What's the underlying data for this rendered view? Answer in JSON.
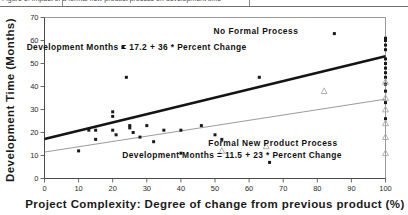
{
  "caption": {
    "text": "Figure 1.  Impact of a formal new product process on development time",
    "visible_fragment": true
  },
  "chart_data": {
    "type": "scatter",
    "title": "",
    "xlabel": "Project Complexity: Degree of change from previous product (%)",
    "ylabel": "Development Time (Months)",
    "xlim": [
      0,
      100
    ],
    "ylim": [
      0,
      70
    ],
    "xticks": [
      0,
      10,
      20,
      30,
      40,
      50,
      60,
      70,
      80,
      90,
      100
    ],
    "yticks": [
      0,
      10,
      20,
      30,
      40,
      50,
      60,
      70
    ],
    "grid": false,
    "legend": "none",
    "annotations": [
      {
        "id": "group-a-title",
        "text": "No Formal Process",
        "x": 62,
        "y": 63
      },
      {
        "id": "group-a-equation",
        "text": "Development Months = 17.2 + 36 * Percent Change",
        "x": 27,
        "y": 56
      },
      {
        "id": "group-b-title",
        "text": "Formal New Product Process",
        "x": 67,
        "y": 14
      },
      {
        "id": "group-b-equation",
        "text": "Development Months = 11.5 + 23 * Percent Change",
        "x": 55,
        "y": 9
      }
    ],
    "series": [
      {
        "name": "No Formal Process",
        "marker": "filled-square",
        "color": "#1a1a1a",
        "fit": {
          "label": "Development Months = 17.2 + 36 * Percent Change",
          "intercept": 17.2,
          "slope_per_100pct": 36,
          "color": "#141414",
          "width": 2.6
        },
        "points": [
          [
            10,
            12
          ],
          [
            13,
            21
          ],
          [
            15,
            21
          ],
          [
            15,
            17
          ],
          [
            20,
            29
          ],
          [
            20,
            27
          ],
          [
            20,
            21
          ],
          [
            21,
            19
          ],
          [
            23,
            57
          ],
          [
            24,
            44
          ],
          [
            25,
            23
          ],
          [
            25,
            22
          ],
          [
            26,
            20
          ],
          [
            28,
            18
          ],
          [
            30,
            23
          ],
          [
            32,
            16
          ],
          [
            35,
            21
          ],
          [
            40,
            21
          ],
          [
            40,
            11
          ],
          [
            46,
            23
          ],
          [
            50,
            19
          ],
          [
            52,
            17
          ],
          [
            63,
            44
          ],
          [
            66,
            7
          ],
          [
            85,
            63
          ],
          [
            100,
            61
          ],
          [
            100,
            60
          ],
          [
            100,
            58
          ],
          [
            100,
            56
          ],
          [
            100,
            52
          ],
          [
            100,
            50
          ],
          [
            100,
            48
          ],
          [
            100,
            46
          ],
          [
            100,
            44
          ],
          [
            100,
            41
          ],
          [
            100,
            38
          ],
          [
            100,
            33
          ],
          [
            100,
            26
          ]
        ]
      },
      {
        "name": "Formal New Product Process",
        "marker": "open-triangle",
        "color": "#a8a8a8",
        "fit": {
          "label": "Development Months = 11.5 + 23 * Percent Change",
          "intercept": 11.5,
          "slope_per_100pct": 23,
          "color": "#9b9b9b",
          "width": 1.0
        },
        "points": [
          [
            52,
            12
          ],
          [
            65,
            14
          ],
          [
            82,
            38
          ],
          [
            100,
            42
          ],
          [
            100,
            35
          ],
          [
            100,
            30
          ],
          [
            100,
            24
          ],
          [
            100,
            18
          ],
          [
            100,
            11
          ]
        ]
      }
    ]
  }
}
